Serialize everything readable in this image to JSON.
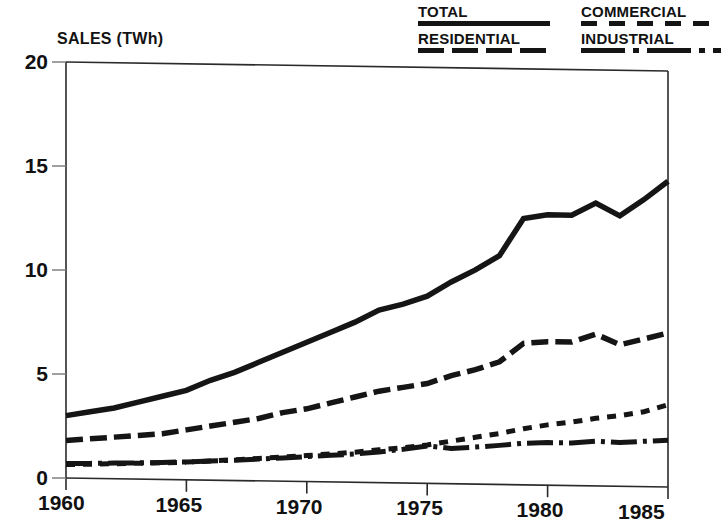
{
  "legend": {
    "entries": [
      {
        "label": "TOTAL",
        "style": "solid",
        "column": "left"
      },
      {
        "label": "RESIDENTIAL",
        "style": "dashed",
        "column": "left"
      },
      {
        "label": "COMMERCIAL",
        "style": "dotted",
        "column": "right"
      },
      {
        "label": "INDUSTRIAL",
        "style": "dashdot",
        "column": "right"
      }
    ]
  },
  "chart_data": {
    "type": "line",
    "title": "",
    "xlabel": "",
    "ylabel": "SALES (TWh)",
    "xlim": [
      1960,
      1985
    ],
    "ylim": [
      0,
      20
    ],
    "grid": false,
    "legend_position": "top-right",
    "xticks": [
      1960,
      1965,
      1970,
      1975,
      1980,
      1985
    ],
    "xtick_labels": [
      "1960",
      "1965",
      "1970",
      "1975",
      "1980",
      "1985"
    ],
    "yticks": [
      0,
      5,
      10,
      15,
      20
    ],
    "ytick_labels": [
      "0",
      "5",
      "10",
      "15",
      "20"
    ],
    "x": [
      1960,
      1961,
      1962,
      1963,
      1964,
      1965,
      1966,
      1967,
      1968,
      1969,
      1970,
      1971,
      1972,
      1973,
      1974,
      1975,
      1976,
      1977,
      1978,
      1979,
      1980,
      1981,
      1982,
      1983,
      1984,
      1985
    ],
    "series": [
      {
        "name": "TOTAL",
        "style": "solid",
        "values": [
          3.0,
          3.2,
          3.4,
          3.7,
          4.0,
          4.3,
          4.8,
          5.2,
          5.7,
          6.2,
          6.7,
          7.2,
          7.7,
          8.3,
          8.6,
          9.0,
          9.7,
          10.3,
          11.0,
          12.8,
          13.0,
          13.0,
          13.6,
          13.0,
          13.8,
          14.7
        ]
      },
      {
        "name": "RESIDENTIAL",
        "style": "dashed",
        "values": [
          1.8,
          1.9,
          2.0,
          2.1,
          2.2,
          2.4,
          2.6,
          2.8,
          3.0,
          3.3,
          3.5,
          3.8,
          4.1,
          4.4,
          4.6,
          4.8,
          5.2,
          5.5,
          5.9,
          6.8,
          6.9,
          6.9,
          7.3,
          6.8,
          7.1,
          7.4
        ]
      },
      {
        "name": "COMMERCIAL",
        "style": "dotted",
        "values": [
          0.65,
          0.68,
          0.72,
          0.76,
          0.8,
          0.85,
          0.92,
          1.0,
          1.08,
          1.16,
          1.25,
          1.35,
          1.45,
          1.58,
          1.7,
          1.85,
          2.05,
          2.25,
          2.45,
          2.7,
          2.9,
          3.05,
          3.25,
          3.4,
          3.6,
          3.95
        ]
      },
      {
        "name": "INDUSTRIAL",
        "style": "dashdot",
        "values": [
          0.7,
          0.72,
          0.75,
          0.78,
          0.82,
          0.86,
          0.92,
          0.98,
          1.05,
          1.12,
          1.2,
          1.28,
          1.36,
          1.48,
          1.62,
          1.8,
          1.7,
          1.78,
          1.88,
          2.0,
          2.05,
          2.05,
          2.15,
          2.1,
          2.18,
          2.25
        ]
      }
    ]
  }
}
